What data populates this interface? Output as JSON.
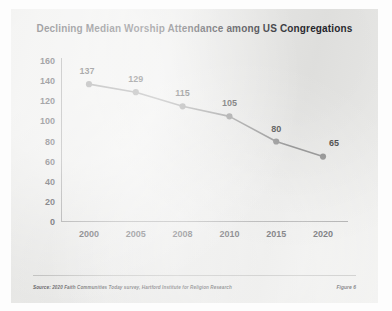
{
  "figure": {
    "source_note": "Source: 2020 Faith Communities Today survey, Hartford Institute for Religion Research",
    "figure_label": "Figure 6"
  },
  "chart_data": {
    "type": "line",
    "title": "Declining Median Worship Attendance among US Congregations",
    "xlabel": "",
    "ylabel": "",
    "categories": [
      "2000",
      "2005",
      "2008",
      "2010",
      "2015",
      "2020"
    ],
    "values": [
      137,
      129,
      115,
      105,
      80,
      65
    ],
    "point_labels": [
      "137",
      "129",
      "115",
      "105",
      "80",
      "65"
    ],
    "yticks": [
      0,
      20,
      40,
      60,
      80,
      100,
      120,
      140,
      160
    ],
    "ytick_labels": [
      "0",
      "20",
      "40",
      "60",
      "80",
      "100",
      "120",
      "140",
      "160"
    ],
    "ylim": [
      0,
      160
    ],
    "grid": false,
    "legend": false,
    "series_color": "#7b7b7b",
    "marker_color": "#7b7b7b",
    "axis_color": "#8d8d8d",
    "panel_color": "#ededeb"
  }
}
